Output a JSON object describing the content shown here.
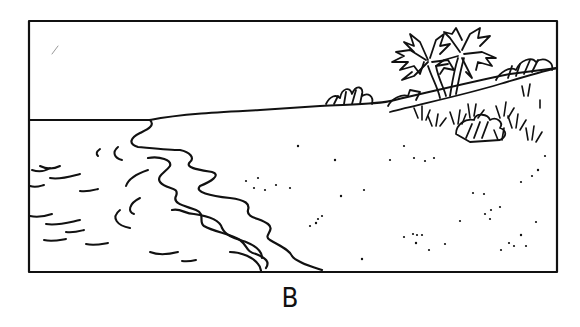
{
  "figure": {
    "label": "B"
  },
  "scene": {
    "elements": [
      "sea-waves",
      "shoreline",
      "sand-dots",
      "dune-slope",
      "palm-trees",
      "shrubs",
      "grass-tufts",
      "horizon"
    ],
    "ink_color": "#111111",
    "background_color": "#ffffff"
  }
}
